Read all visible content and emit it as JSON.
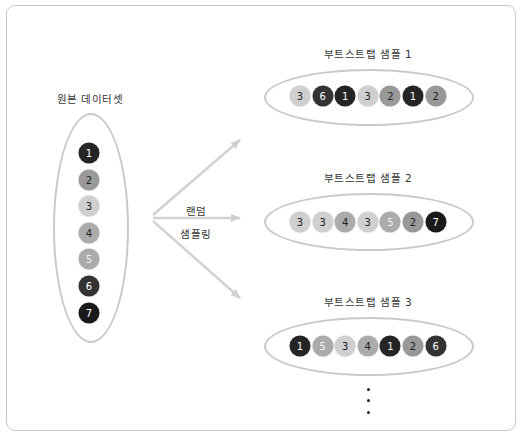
{
  "original": {
    "title": "원본 데이터셋",
    "items": [
      {
        "value": "1",
        "color": "#252525",
        "text_color": "#ffffff"
      },
      {
        "value": "2",
        "color": "#999999",
        "text_color": "#222222"
      },
      {
        "value": "3",
        "color": "#cfcfcf",
        "text_color": "#222222"
      },
      {
        "value": "4",
        "color": "#ababab",
        "text_color": "#222222"
      },
      {
        "value": "5",
        "color": "#ababab",
        "text_color": "#f2f2f2"
      },
      {
        "value": "6",
        "color": "#333333",
        "text_color": "#ffffff"
      },
      {
        "value": "7",
        "color": "#1a1a1a",
        "text_color": "#ffffff"
      }
    ]
  },
  "arrow_label": {
    "line1": "랜덤",
    "line2": "샘플링"
  },
  "samples": [
    {
      "title": "부트스트랩 샘플 1",
      "items": [
        "3",
        "6",
        "1",
        "3",
        "2",
        "1",
        "2"
      ]
    },
    {
      "title": "부트스트랩 샘플 2",
      "items": [
        "3",
        "3",
        "4",
        "3",
        "5",
        "2",
        "7"
      ]
    },
    {
      "title": "부트스트랩 샘플 3",
      "items": [
        "1",
        "5",
        "3",
        "4",
        "1",
        "2",
        "6"
      ]
    }
  ],
  "ellipsis": "⋮",
  "colors": {
    "1": {
      "bg": "#252525",
      "fg": "#ffffff"
    },
    "2": {
      "bg": "#999999",
      "fg": "#222222"
    },
    "3": {
      "bg": "#cfcfcf",
      "fg": "#222222"
    },
    "4": {
      "bg": "#ababab",
      "fg": "#222222"
    },
    "5": {
      "bg": "#ababab",
      "fg": "#f2f2f2"
    },
    "6": {
      "bg": "#333333",
      "fg": "#ffffff"
    },
    "7": {
      "bg": "#1a1a1a",
      "fg": "#ffffff"
    },
    "frame": "#c8c8c8",
    "ellipse": "#c9c9c9",
    "arrow": "#cfcfcf"
  }
}
